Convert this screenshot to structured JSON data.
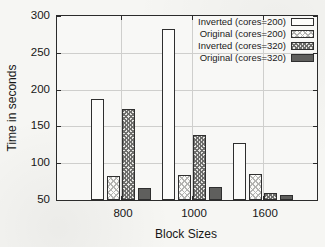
{
  "figure": {
    "background_color": "#f6f6f3",
    "axis_color": "#2b2b2b",
    "grid_color": "#cfcfcd",
    "text_color": "#161616",
    "solid_bar_color": "#5f5f5d"
  },
  "chart_data": {
    "type": "bar",
    "title": "",
    "xlabel": "Block Sizes",
    "ylabel": "Time in seconds",
    "categories": [
      "800",
      "1000",
      "1600"
    ],
    "series": [
      {
        "name": "Inverted (cores=200)",
        "style": "white-outline",
        "values": [
          187,
          282,
          128
        ]
      },
      {
        "name": "Original (cores=200)",
        "style": "light-crosshatch",
        "values": [
          82,
          84,
          85
        ]
      },
      {
        "name": "Inverted (cores=320)",
        "style": "dense-crosshatch",
        "values": [
          174,
          139,
          59
        ]
      },
      {
        "name": "Original (cores=320)",
        "style": "solid-dark",
        "values": [
          67,
          68,
          57
        ]
      }
    ],
    "ylim": [
      50,
      300
    ],
    "yticks": [
      50,
      100,
      150,
      200,
      250,
      300
    ],
    "grid": true,
    "legend_position": "top-right"
  }
}
